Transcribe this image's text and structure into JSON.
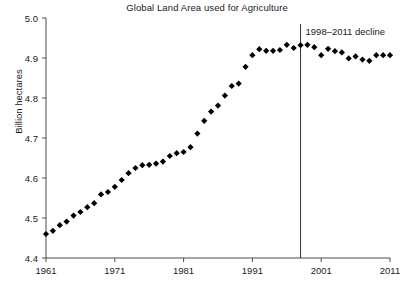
{
  "chart_data": {
    "type": "scatter",
    "title": "Global Land Area used for Agriculture",
    "xlabel": "",
    "ylabel": "Billion hectares",
    "ylim": [
      4.4,
      5.0
    ],
    "xlim": [
      1961,
      2011
    ],
    "yticks": [
      "4.4",
      "4.5",
      "4.6",
      "4.7",
      "4.8",
      "4.9",
      "5.0"
    ],
    "ytick_values": [
      4.4,
      4.5,
      4.6,
      4.7,
      4.8,
      4.9,
      5.0
    ],
    "xticks": [
      "1961",
      "1971",
      "1981",
      "1991",
      "2001",
      "2011"
    ],
    "xtick_values": [
      1961,
      1971,
      1981,
      1991,
      2001,
      2011
    ],
    "grid": false,
    "legend": null,
    "marker": "diamond",
    "marker_color": "#000000",
    "x": [
      1961,
      1962,
      1963,
      1964,
      1965,
      1966,
      1967,
      1968,
      1969,
      1970,
      1971,
      1972,
      1973,
      1974,
      1975,
      1976,
      1977,
      1978,
      1979,
      1980,
      1981,
      1982,
      1983,
      1984,
      1985,
      1986,
      1987,
      1988,
      1989,
      1990,
      1991,
      1992,
      1993,
      1994,
      1995,
      1996,
      1997,
      1998,
      1999,
      2000,
      2001,
      2002,
      2003,
      2004,
      2005,
      2006,
      2007,
      2008,
      2009,
      2010,
      2011
    ],
    "values": [
      4.46,
      4.468,
      4.482,
      4.491,
      4.506,
      4.515,
      4.527,
      4.537,
      4.559,
      4.565,
      4.578,
      4.595,
      4.612,
      4.625,
      4.632,
      4.633,
      4.636,
      4.641,
      4.655,
      4.662,
      4.665,
      4.677,
      4.711,
      4.743,
      4.766,
      4.781,
      4.806,
      4.83,
      4.836,
      4.878,
      4.907,
      4.922,
      4.918,
      4.918,
      4.92,
      4.933,
      4.925,
      4.932,
      4.933,
      4.927,
      4.907,
      4.923,
      4.917,
      4.914,
      4.899,
      4.904,
      4.896,
      4.893,
      4.907,
      4.907,
      4.907
    ],
    "annotations": [
      {
        "name": "decline-marker",
        "text": "1998–2011 decline",
        "x_value": 1998,
        "type": "vline-with-label"
      }
    ]
  }
}
